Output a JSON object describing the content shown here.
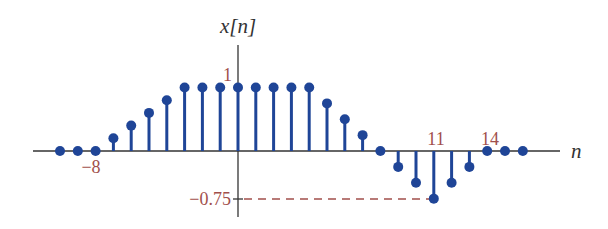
{
  "chart_data": {
    "type": "stem",
    "title": "x[n]",
    "xlabel": "n",
    "ylabel": "x[n]",
    "x": [
      -10,
      -9,
      -8,
      -7,
      -6,
      -5,
      -4,
      -3,
      -2,
      -1,
      0,
      1,
      2,
      3,
      4,
      5,
      6,
      7,
      8,
      9,
      10,
      11,
      12,
      13,
      14,
      15,
      16
    ],
    "values": [
      0,
      0,
      0,
      0.2,
      0.4,
      0.6,
      0.8,
      1,
      1,
      1,
      1,
      1,
      1,
      1,
      1,
      0.75,
      0.5,
      0.25,
      0,
      -0.25,
      -0.5,
      -0.75,
      -0.5,
      -0.25,
      0,
      0,
      0
    ],
    "annotations": [
      {
        "text": "1",
        "at": "y=1 on vertical axis"
      },
      {
        "text": "−0.75",
        "at": "y=-0.75 on vertical axis, dashed line to n=11"
      },
      {
        "text": "−8",
        "at": "n=-8 below axis"
      },
      {
        "text": "11",
        "at": "n=11 above axis"
      },
      {
        "text": "14",
        "at": "n=14 above axis"
      }
    ],
    "xlim": [
      -11,
      18
    ],
    "ylim": [
      -1,
      1.6
    ],
    "grid": false,
    "legend": null
  },
  "labels": {
    "y_axis": "x[n]",
    "x_axis": "n",
    "tick_one": "1",
    "tick_neg075": "−0.75",
    "tick_neg8": "−8",
    "tick_11": "11",
    "tick_14": "14"
  },
  "colors": {
    "stem": "#1f4597",
    "axis": "#333333",
    "annotation": "#a14f4b"
  }
}
